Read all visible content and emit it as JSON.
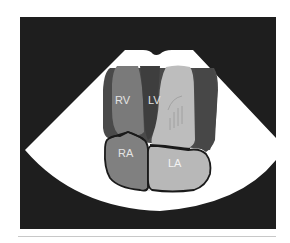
{
  "diagram": {
    "type": "echocardiography-apical-four-chamber-schematic",
    "colors": {
      "page_background": "#ffffff",
      "frame_background": "#1e1e1e",
      "sector": "#ffffff",
      "myocardium": "#4a4a4a",
      "rv_cavity": "#7a7a7a",
      "lv_cavity": "#bdbdbd",
      "ra_cavity": "#808080",
      "la_cavity": "#b8b8b8",
      "outline": "#1a1a1a",
      "bottom_rule": "#c8c8c8"
    },
    "chambers": [
      {
        "id": "rv",
        "label": "RV",
        "name": "Right ventricle"
      },
      {
        "id": "lv",
        "label": "LV",
        "name": "Left ventricle"
      },
      {
        "id": "ra",
        "label": "RA",
        "name": "Right atrium"
      },
      {
        "id": "la",
        "label": "LA",
        "name": "Left atrium"
      }
    ]
  }
}
